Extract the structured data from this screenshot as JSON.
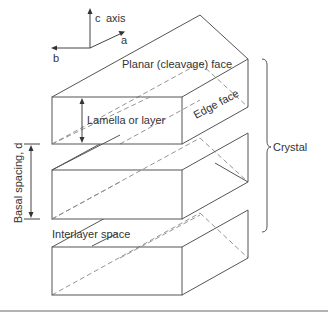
{
  "diagram": {
    "axes": {
      "c_label": "c",
      "axis_word": "axis",
      "a_label": "a",
      "b_label": "b"
    },
    "labels": {
      "planar_face": "Planar (cleavage) face",
      "edge_face": "Edge face",
      "lamella": "Lamella or layer",
      "basal_spacing": "Basal spacing, d",
      "interlayer": "Interlayer space",
      "crystal": "Crystal"
    },
    "layers": [
      {
        "name": "top-layer",
        "front_top_y": 97,
        "front_bottom_y": 144
      },
      {
        "name": "middle-layer",
        "front_top_y": 170,
        "front_bottom_y": 219
      },
      {
        "name": "bottom-layer",
        "front_top_y": 247,
        "front_bottom_y": 295
      }
    ],
    "colors": {
      "line": "#555555",
      "hidden_line": "#888888",
      "text": "#333333",
      "background": "#ffffff"
    }
  }
}
